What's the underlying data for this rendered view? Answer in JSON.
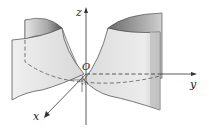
{
  "figure": {
    "axes": {
      "x_label": "x",
      "y_label": "y",
      "z_label": "z",
      "origin_label": "O"
    },
    "colors": {
      "surface_light": "#ececec",
      "surface_mid": "#d4d4d4",
      "surface_dark": "#7a7a7a",
      "line": "#333333"
    }
  }
}
